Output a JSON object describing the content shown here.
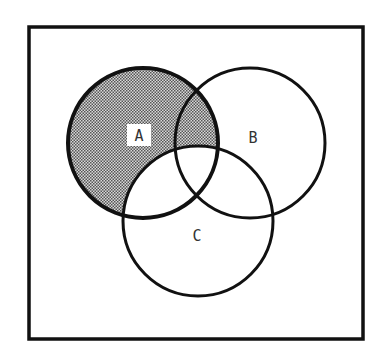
{
  "diagram": {
    "type": "venn",
    "sets": [
      {
        "name": "A",
        "label": "A",
        "cx": 143,
        "cy": 143,
        "r": 75
      },
      {
        "name": "B",
        "label": "B",
        "cx": 250,
        "cy": 143,
        "r": 75
      },
      {
        "name": "C",
        "label": "C",
        "cx": 198,
        "cy": 221,
        "r": 75
      }
    ],
    "shaded_region": "A minus C",
    "colors": {
      "stroke": "#111111",
      "shade": "#9a9a9a",
      "background": "#ffffff"
    }
  }
}
